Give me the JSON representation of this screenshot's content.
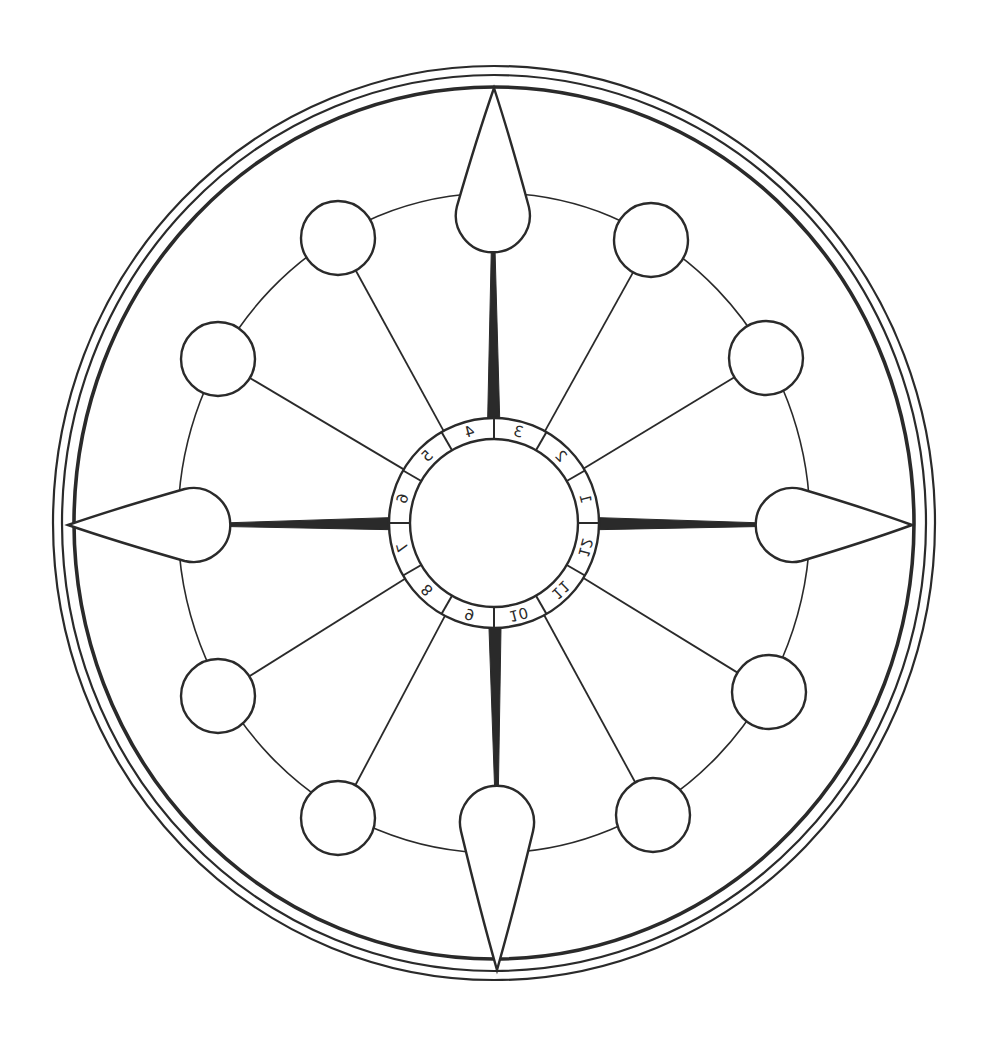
{
  "diagram": {
    "stroke_color": "#2a2a2a",
    "background": "#ffffff",
    "center": {
      "x": 494,
      "y": 523
    },
    "outer_rings": [
      {
        "rx": 441,
        "ry": 457,
        "width": 2.2
      },
      {
        "rx": 432,
        "ry": 448,
        "width": 2.2
      },
      {
        "rx": 420,
        "ry": 436,
        "width": 3.6
      }
    ],
    "node_ring": {
      "rx": 316,
      "ry": 330,
      "width": 1.6
    },
    "hub": {
      "inner_r": 84,
      "outer_r": 105
    },
    "ring_numbers": [
      "1",
      "2",
      "3",
      "4",
      "5",
      "6",
      "7",
      "8",
      "9",
      "10",
      "11",
      "12"
    ],
    "ring_number_angles": [
      -15,
      -45,
      -75,
      -105,
      -135,
      -165,
      165,
      135,
      105,
      75,
      45,
      15
    ],
    "teardrops": [
      {
        "name": "teardrop-top",
        "cx": 493,
        "cy": 198,
        "r": 37,
        "tipx": 494,
        "tipy": 88
      },
      {
        "name": "teardrop-right",
        "cx": 810,
        "cy": 525,
        "r": 37,
        "tipx": 912,
        "tipy": 525
      },
      {
        "name": "teardrop-bottom",
        "cx": 497,
        "cy": 840,
        "r": 37,
        "tipx": 497,
        "tipy": 970
      },
      {
        "name": "teardrop-left",
        "cx": 176,
        "cy": 525,
        "r": 37,
        "tipx": 68,
        "tipy": 525
      }
    ],
    "nodes": [
      {
        "name": "node-1",
        "cx": 651,
        "cy": 240,
        "r": 37
      },
      {
        "name": "node-2",
        "cx": 766,
        "cy": 358,
        "r": 37
      },
      {
        "name": "node-3",
        "cx": 769,
        "cy": 692,
        "r": 37
      },
      {
        "name": "node-4",
        "cx": 653,
        "cy": 815,
        "r": 37
      },
      {
        "name": "node-5",
        "cx": 338,
        "cy": 818,
        "r": 37
      },
      {
        "name": "node-6",
        "cx": 218,
        "cy": 696,
        "r": 37
      },
      {
        "name": "node-7",
        "cx": 218,
        "cy": 359,
        "r": 37
      },
      {
        "name": "node-8",
        "cx": 338,
        "cy": 238,
        "r": 37
      }
    ]
  }
}
